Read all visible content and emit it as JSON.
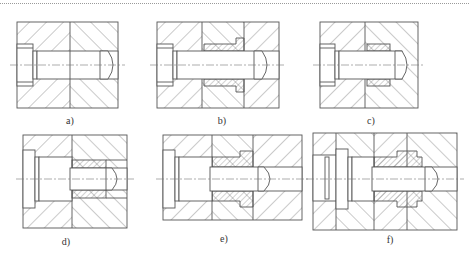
{
  "figure": {
    "type": "engineering cross-section drawings",
    "panels": [
      {
        "id": "a",
        "label": "a)",
        "description": "pin through two plates without bushing"
      },
      {
        "id": "b",
        "label": "b)",
        "description": "pin with flanged bushing in middle plate, recessed"
      },
      {
        "id": "c",
        "label": "c)",
        "description": "pin with plain bushing in second plate"
      },
      {
        "id": "d",
        "label": "d)",
        "description": "stepped pin with bushing in second plate"
      },
      {
        "id": "e",
        "label": "e)",
        "description": "stepped pin with flanged bushing across three plates"
      },
      {
        "id": "f",
        "label": "f)",
        "description": "stepped pin with double-flanged bushing across four plates"
      }
    ]
  },
  "colors": {
    "line": "#555555",
    "background": "#ffffff",
    "hatch": "#666666"
  }
}
